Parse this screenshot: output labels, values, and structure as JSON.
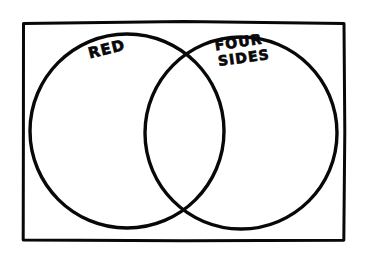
{
  "figure": {
    "type": "venn-diagram",
    "style": "hand-drawn marker sketch",
    "background_color": "#ffffff",
    "ink_color": "#080808"
  },
  "frame": {
    "name": "universal-set-rectangle",
    "x": 22,
    "y": 22,
    "width": 323,
    "height": 219,
    "stroke_width": 3
  },
  "sets": [
    {
      "id": "left",
      "label": "RED",
      "label_lines": [
        "RED"
      ],
      "cx": 127,
      "cy": 131,
      "r": 97,
      "stroke_width": 3.4,
      "label_x": 108,
      "label_y": 54,
      "label_rotation": -14,
      "label_font_size": 15
    },
    {
      "id": "right",
      "label": "FOUR SIDES",
      "label_lines": [
        "FOUR",
        "SIDES"
      ],
      "cx": 241,
      "cy": 133,
      "r": 96,
      "stroke_width": 3.4,
      "label_x": 240,
      "label_y": 47,
      "label_rotation": -8,
      "label_font_size": 14
    }
  ],
  "regions": {
    "left_only": "",
    "intersection": "",
    "right_only": "",
    "outside": ""
  }
}
